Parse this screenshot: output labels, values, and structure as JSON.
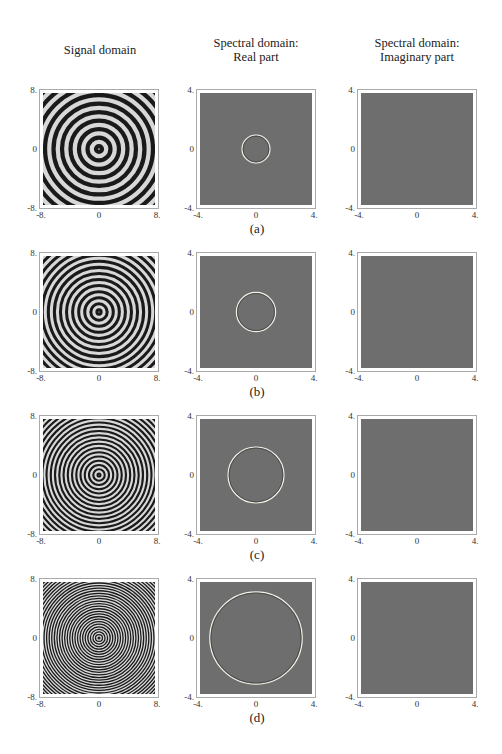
{
  "column_titles": {
    "signal": "Signal domain",
    "real_line1": "Spectral domain:",
    "real_line2": "Real part",
    "imag_line1": "Spectral domain:",
    "imag_line2": "Imaginary part"
  },
  "ticks": {
    "signal": {
      "min": "-8.",
      "mid": "0",
      "max": "8."
    },
    "spectral": {
      "min": "-4.",
      "mid": "0",
      "max": "4."
    }
  },
  "rows": [
    {
      "caption": "(a)",
      "ring_freq": 1.0,
      "circle_radius": 1.0
    },
    {
      "caption": "(b)",
      "ring_freq": 1.4,
      "circle_radius": 1.4
    },
    {
      "caption": "(c)",
      "ring_freq": 2.0,
      "circle_radius": 2.0
    },
    {
      "caption": "(d)",
      "ring_freq": 3.3,
      "circle_radius": 3.3
    }
  ],
  "chart_data": {
    "type": "heatmap",
    "title": "",
    "columns": [
      "Signal domain",
      "Spectral domain: Real part",
      "Spectral domain: Imaginary part"
    ],
    "signal_axis_range": [
      -8,
      8
    ],
    "spectral_axis_range": [
      -4,
      4
    ],
    "tick_labels_signal": [
      "-8.",
      "0",
      "8."
    ],
    "tick_labels_spectral": [
      "-4.",
      "0",
      "4."
    ],
    "panels": [
      {
        "row": "(a)",
        "signal": "concentric rings, low frequency",
        "real_part_circle_radius": 1.0,
        "imag_part": "uniform gray"
      },
      {
        "row": "(b)",
        "signal": "concentric rings, medium frequency",
        "real_part_circle_radius": 1.4,
        "imag_part": "uniform gray"
      },
      {
        "row": "(c)",
        "signal": "concentric rings, higher frequency",
        "real_part_circle_radius": 2.0,
        "imag_part": "uniform gray"
      },
      {
        "row": "(d)",
        "signal": "concentric rings, highest frequency",
        "real_part_circle_radius": 3.3,
        "imag_part": "uniform gray"
      }
    ]
  }
}
